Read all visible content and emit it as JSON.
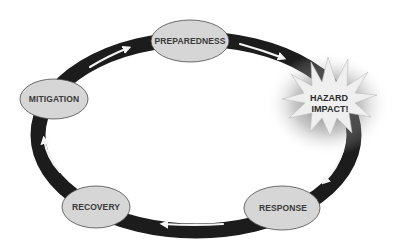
{
  "diagram": {
    "type": "cycle",
    "title": "",
    "direction": "clockwise",
    "colors": {
      "ring": "#1c1c1c",
      "arrow": "#f4f4f4",
      "node_fill": "#d6d6d6",
      "node_stroke": "#4a4a4a",
      "burst_fill": "#efefef",
      "burst_shadow": "#6a6a6a",
      "text": "#3a3a3a"
    },
    "nodes": [
      {
        "id": "preparedness",
        "label": "PREPAREDNESS",
        "shape": "ellipse"
      },
      {
        "id": "hazard",
        "label_line1": "HAZARD",
        "label_line2": "IMPACT!",
        "shape": "starburst"
      },
      {
        "id": "response",
        "label": "RESPONSE",
        "shape": "ellipse"
      },
      {
        "id": "recovery",
        "label": "RECOVERY",
        "shape": "ellipse"
      },
      {
        "id": "mitigation",
        "label": "MITIGATION",
        "shape": "ellipse"
      }
    ],
    "edges": [
      {
        "from": "preparedness",
        "to": "hazard"
      },
      {
        "from": "hazard",
        "to": "response"
      },
      {
        "from": "response",
        "to": "recovery"
      },
      {
        "from": "recovery",
        "to": "mitigation"
      },
      {
        "from": "mitigation",
        "to": "preparedness"
      }
    ]
  }
}
